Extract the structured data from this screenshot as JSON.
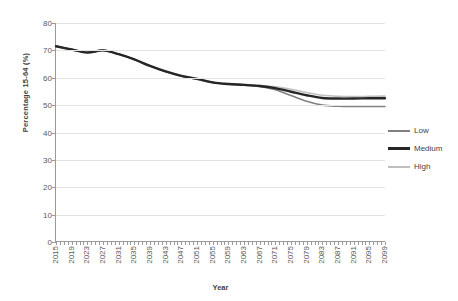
{
  "chart_data": {
    "type": "line",
    "title": "",
    "xlabel": "Year",
    "ylabel": "Percentage 15-64 (%)",
    "xlim": [
      2015,
      2099
    ],
    "ylim": [
      0,
      80
    ],
    "ytick_step": 10,
    "yticks": [
      0,
      10,
      20,
      30,
      40,
      50,
      60,
      70,
      80
    ],
    "xticks_labeled": [
      2015,
      2019,
      2023,
      2027,
      2031,
      2035,
      2039,
      2043,
      2047,
      2051,
      2055,
      2059,
      2063,
      2067,
      2071,
      2075,
      2079,
      2083,
      2087,
      2091,
      2095,
      2099
    ],
    "xtick_minor_step": 1,
    "grid": "horizontal",
    "legend_position": "right",
    "x": [
      2015,
      2019,
      2023,
      2027,
      2031,
      2035,
      2039,
      2043,
      2047,
      2051,
      2055,
      2059,
      2063,
      2067,
      2071,
      2075,
      2079,
      2083,
      2087,
      2091,
      2095,
      2099
    ],
    "series": [
      {
        "name": "Low",
        "color": "#808080",
        "width": 1.6,
        "values": [
          71.5,
          70.3,
          69.2,
          70.0,
          68.6,
          66.7,
          64.3,
          62.2,
          60.6,
          59.5,
          58.2,
          57.6,
          57.3,
          56.8,
          55.6,
          53.5,
          51.4,
          50.0,
          49.6,
          49.5,
          49.5,
          49.5
        ]
      },
      {
        "name": "Medium",
        "color": "#262626",
        "width": 2.4,
        "values": [
          71.5,
          70.3,
          69.2,
          70.0,
          68.6,
          66.7,
          64.3,
          62.3,
          60.7,
          59.6,
          58.3,
          57.7,
          57.4,
          57.0,
          56.2,
          54.9,
          53.6,
          52.6,
          52.4,
          52.4,
          52.5,
          52.5
        ]
      },
      {
        "name": "High",
        "color": "#bfbfbf",
        "width": 1.6,
        "values": [
          71.6,
          70.4,
          69.3,
          70.1,
          68.7,
          66.8,
          64.4,
          62.4,
          60.8,
          59.7,
          58.4,
          57.8,
          57.5,
          57.2,
          56.7,
          55.8,
          54.6,
          53.6,
          53.2,
          53.1,
          53.2,
          53.3
        ]
      }
    ]
  },
  "legend": {
    "items": [
      {
        "label": "Low"
      },
      {
        "label": "Medium"
      },
      {
        "label": "High"
      }
    ]
  }
}
